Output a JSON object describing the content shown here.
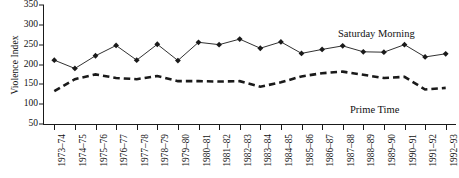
{
  "chart_data": {
    "type": "line",
    "title": "",
    "xlabel": "",
    "ylabel": "Violence Index",
    "ylim": [
      50,
      350
    ],
    "yticks": [
      350,
      300,
      250,
      200,
      150,
      100,
      50
    ],
    "grid": false,
    "legend_position": "inline-annotation",
    "categories": [
      "1973–74",
      "1974–75",
      "1975–76",
      "1976–77",
      "1977–78",
      "1978–79",
      "1979–80",
      "1980–81",
      "1981–82",
      "1982–83",
      "1983–84",
      "1984–85",
      "1985–86",
      "1986–87",
      "1987–88",
      "1988–89",
      "1989–90",
      "1990–91",
      "1991–92",
      "1992–93"
    ],
    "series": [
      {
        "name": "Saturday Morning",
        "style": "solid-with-diamond-markers",
        "color": "#1a1a1a",
        "values": [
          211,
          190,
          222,
          248,
          211,
          251,
          210,
          256,
          250,
          264,
          241,
          257,
          228,
          238,
          247,
          232,
          231,
          250,
          219,
          227
        ]
      },
      {
        "name": "Prime Time",
        "style": "dashed",
        "color": "#1a1a1a",
        "values": [
          133,
          163,
          175,
          166,
          163,
          171,
          158,
          158,
          157,
          158,
          144,
          155,
          170,
          178,
          182,
          174,
          166,
          169,
          137,
          141
        ]
      }
    ],
    "annotations": [
      {
        "text": "Saturday Morning",
        "series": "Saturday Morning"
      },
      {
        "text": "Prime Time",
        "series": "Prime Time"
      }
    ]
  },
  "axis": {
    "y_title": "Violence Index",
    "y_ticks": [
      "350",
      "300",
      "250",
      "200",
      "150",
      "100",
      "50"
    ]
  },
  "labels": {
    "saturday_morning": "Saturday Morning",
    "prime_time": "Prime Time"
  }
}
